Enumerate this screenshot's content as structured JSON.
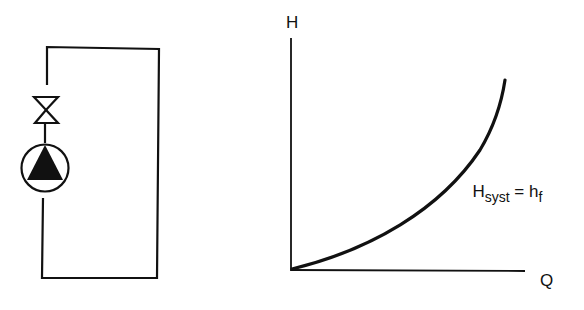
{
  "diagram": {
    "circuit": {
      "components": [
        "valve",
        "pump"
      ],
      "description": "Closed pipe loop with valve and pump"
    },
    "graph": {
      "y_axis_label": "H",
      "x_axis_label": "Q",
      "curve_label": {
        "main": "H",
        "main_sub": "syst",
        "eq": " = ",
        "rhs": "h",
        "rhs_sub": "f"
      }
    }
  },
  "colors": {
    "ink": "#111111",
    "background": "#ffffff"
  }
}
